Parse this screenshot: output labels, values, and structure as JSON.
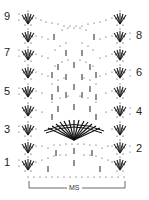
{
  "diagram": {
    "type": "crochet-chart",
    "left_row_labels": [
      "9",
      "7",
      "5",
      "3",
      "1"
    ],
    "right_row_labels": [
      "8",
      "6",
      "4",
      "2"
    ],
    "repeat_label": "MS",
    "colors": {
      "ink": "#222222",
      "background": "#ffffff"
    }
  }
}
